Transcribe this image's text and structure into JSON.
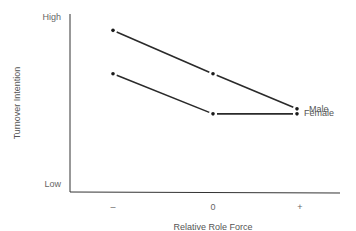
{
  "chart_data": {
    "type": "line",
    "title": "",
    "xlabel": "Relative Role Force",
    "ylabel": "Turnover Intention",
    "categories": [
      "–",
      "0",
      "+"
    ],
    "y_tick_labels": [
      "High",
      "Low"
    ],
    "ylim": [
      0,
      10
    ],
    "grid": false,
    "legend_position": "inline-right",
    "series": [
      {
        "name": "Male",
        "values": [
          9.2,
          6.6,
          4.5
        ]
      },
      {
        "name": "Female",
        "values": [
          6.6,
          4.2,
          4.2
        ]
      }
    ]
  }
}
